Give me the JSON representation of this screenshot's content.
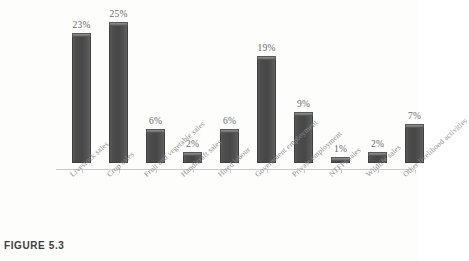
{
  "figure": {
    "caption": "FIGURE 5.3"
  },
  "chart_data": {
    "type": "bar",
    "title": "",
    "xlabel": "",
    "ylabel": "",
    "ylim": [
      0,
      25
    ],
    "grid": false,
    "legend": "none",
    "value_suffix": "%",
    "categories": [
      "Livestock sales",
      "Crop sales",
      "Fruit and vegetable sales",
      "Handicraft sales",
      "Hired labour",
      "Government employment",
      "Private employment",
      "NTFPs sales",
      "Wildlife sales",
      "Other livelihood activities"
    ],
    "values": [
      23,
      25,
      6,
      2,
      6,
      19,
      9,
      1,
      2,
      7
    ],
    "value_labels": [
      "23%",
      "25%",
      "6%",
      "2%",
      "6%",
      "19%",
      "9%",
      "1%",
      "2%",
      "7%"
    ],
    "colors": {
      "bar_front": "#4a4a4a",
      "bar_top": "#7d7d7d",
      "axis": "#c9c9c9",
      "label_text": "#8c8c8c",
      "value_text": "#6a6a6a",
      "background": "#fdfdfc"
    }
  }
}
